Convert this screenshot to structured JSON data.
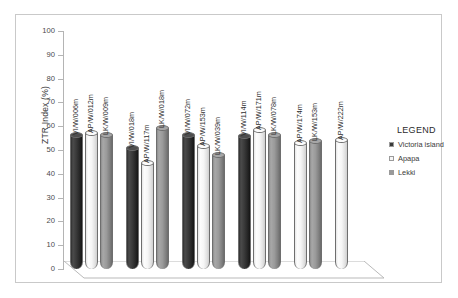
{
  "chart_data": {
    "type": "bar",
    "title": "",
    "subtitle": "",
    "xlabel": "",
    "ylabel": "ZTR Index (%)",
    "ylim": [
      0,
      100
    ],
    "ytick_step": 10,
    "yticks": [
      "100",
      "90",
      "80",
      "70",
      "60",
      "50",
      "40",
      "30",
      "20",
      "10",
      "0"
    ],
    "grid": false,
    "style": "3d-cylinder",
    "legend_position": "right",
    "legend_title": "LEGEND",
    "series": [
      {
        "name": "Victoria island",
        "color": "#3a3a3a"
      },
      {
        "name": "Apapa",
        "color": "#f6f6f6"
      },
      {
        "name": "Lekki",
        "color": "#9a9a9a"
      }
    ],
    "groups": [
      {
        "bars": [
          {
            "series": "Victoria island",
            "label": "VI/W/006m",
            "value": 57.5
          },
          {
            "series": "Apapa",
            "label": "AP/W/012m",
            "value": 58.5
          },
          {
            "series": "Lekki",
            "label": "LK/W/009m",
            "value": 57.5
          }
        ]
      },
      {
        "bars": [
          {
            "series": "Victoria island",
            "label": "VI/W/018m",
            "value": 52.0
          },
          {
            "series": "Apapa",
            "label": "AP/W/117m",
            "value": 46.0
          },
          {
            "series": "Lekki",
            "label": "LK/W/018m",
            "value": 60.5
          }
        ]
      },
      {
        "bars": [
          {
            "series": "Victoria island",
            "label": "VI/W/072m",
            "value": 57.5
          },
          {
            "series": "Apapa",
            "label": "AP/W/153m",
            "value": 53.0
          },
          {
            "series": "Lekki",
            "label": "LK/W/039m",
            "value": 49.0
          }
        ]
      },
      {
        "bars": [
          {
            "series": "Victoria island",
            "label": "VI/W/114m",
            "value": 57.0
          },
          {
            "series": "Apapa",
            "label": "AP/W/171m",
            "value": 59.5
          },
          {
            "series": "Lekki",
            "label": "LK/W/078m",
            "value": 57.5
          }
        ]
      },
      {
        "bars": [
          {
            "series": "Apapa",
            "label": "AP/W/174m",
            "value": 54.0
          },
          {
            "series": "Lekki",
            "label": "LK/W/153m",
            "value": 55.0
          }
        ]
      },
      {
        "bars": [
          {
            "series": "Apapa",
            "label": "AP/W/222m",
            "value": 55.5
          }
        ]
      }
    ]
  }
}
